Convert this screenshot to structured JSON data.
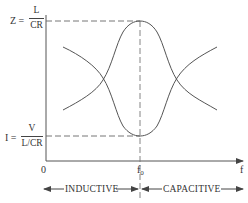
{
  "diagram": {
    "title": "",
    "y_top_label": {
      "lhs": "Z =",
      "numerator": "L",
      "denominator": "CR"
    },
    "y_bottom_label": {
      "lhs": "I =",
      "numerator": "V",
      "denominator": "L/CR"
    },
    "origin_label": "0",
    "resonance_label": "f",
    "resonance_subscript": "0",
    "x_axis_label": "f",
    "regions": {
      "left": "INDUCTIVE",
      "right": "CAPACITIVE"
    },
    "curves": [
      {
        "name": "impedance-Z",
        "shape": "peak at f0",
        "value_at_f0": "Z = L/CR"
      },
      {
        "name": "current-I",
        "shape": "minimum at f0",
        "value_at_f0": "I = V/(L/CR)"
      },
      {
        "name": "inductive-reactance-branch",
        "shape": "decreasing"
      },
      {
        "name": "capacitive-reactance-branch",
        "shape": "increasing"
      }
    ],
    "colors": {
      "ink": "#444444",
      "background": "#ffffff"
    }
  }
}
